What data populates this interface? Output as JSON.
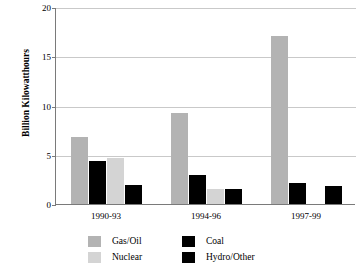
{
  "chart_data": {
    "type": "bar",
    "title": "",
    "xlabel": "",
    "ylabel": "Billion Kilowatthours",
    "ylim": [
      0,
      20
    ],
    "yticks": [
      "0",
      "5",
      "10",
      "15",
      "20"
    ],
    "grid": true,
    "legend_position": "bottom",
    "categories": [
      "1990-93",
      "1994-96",
      "1997-99"
    ],
    "series": [
      {
        "name": "Gas/Oil",
        "color": "#b3b3b3",
        "values": [
          6.8,
          9.2,
          17.1
        ]
      },
      {
        "name": "Coal",
        "color": "#000000",
        "values": [
          4.4,
          2.9,
          2.1
        ]
      },
      {
        "name": "Nuclear",
        "color": "#d4d4d4",
        "values": [
          4.7,
          1.5,
          0.0
        ]
      },
      {
        "name": "Hydro/Other",
        "color": "#000000",
        "values": [
          1.9,
          1.5,
          1.8
        ]
      }
    ]
  },
  "legend": {
    "entries": [
      {
        "label": "Gas/Oil",
        "swatch": "gasoil"
      },
      {
        "label": "Coal",
        "swatch": "coal"
      },
      {
        "label": "Nuclear",
        "swatch": "nuclear"
      },
      {
        "label": "Hydro/Other",
        "swatch": "hydro"
      }
    ]
  }
}
